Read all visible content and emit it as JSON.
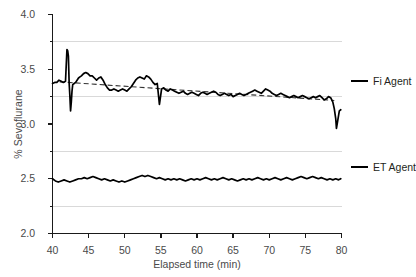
{
  "chart_data": {
    "type": "line",
    "title": "",
    "xlabel": "Elapsed time (min)",
    "ylabel": "% Sevoflurane",
    "xlim": [
      40,
      80
    ],
    "ylim": [
      2.0,
      4.0
    ],
    "xticks": [
      40,
      45,
      50,
      55,
      60,
      65,
      70,
      75,
      80
    ],
    "xtick_labels": [
      "40",
      "45",
      "50",
      "55",
      "60",
      "65",
      "70",
      "75",
      "80"
    ],
    "yticks": [
      2.0,
      2.5,
      3.0,
      3.5,
      4.0
    ],
    "ytick_labels": [
      "2.0",
      "2.5",
      "3.0",
      "3.5",
      "4.0"
    ],
    "yminorticks": [
      2.25,
      2.75,
      3.25,
      3.75
    ],
    "grid": "horizontal-minor",
    "gridlines": [
      2.25,
      2.75,
      3.25,
      3.75
    ],
    "legend_position": "right",
    "legend": [
      "Fi Agent",
      "ET Agent"
    ],
    "annotations": [
      "dashed linear trend line fitted to Fi Agent trace"
    ],
    "trendline": {
      "name": "Fi Agent trend",
      "style": "dashed",
      "x": [
        41.0,
        79.0
      ],
      "y": [
        3.385,
        3.215
      ]
    },
    "series": [
      {
        "name": "Fi Agent",
        "color": "#000000",
        "x": [
          40.0,
          40.3,
          40.6,
          40.9,
          41.2,
          41.5,
          41.8,
          42.0,
          42.1,
          42.2,
          42.3,
          42.4,
          42.5,
          42.6,
          42.7,
          42.8,
          43.0,
          43.2,
          43.4,
          43.6,
          43.8,
          44.0,
          44.3,
          44.6,
          44.9,
          45.2,
          45.5,
          45.8,
          46.1,
          46.4,
          46.7,
          47.0,
          47.3,
          47.6,
          47.9,
          48.2,
          48.5,
          48.8,
          49.1,
          49.4,
          49.7,
          50.0,
          50.3,
          50.6,
          50.9,
          51.2,
          51.5,
          51.8,
          52.1,
          52.4,
          52.7,
          53.0,
          53.3,
          53.6,
          53.9,
          54.2,
          54.5,
          54.8,
          55.1,
          55.4,
          55.7,
          56.0,
          56.3,
          56.6,
          56.9,
          57.2,
          57.5,
          57.8,
          58.1,
          58.4,
          58.7,
          59.0,
          59.3,
          59.6,
          59.9,
          60.2,
          60.5,
          60.8,
          61.1,
          61.4,
          61.7,
          62.0,
          62.3,
          62.6,
          62.9,
          63.2,
          63.5,
          63.8,
          64.1,
          64.4,
          64.7,
          65.0,
          65.3,
          65.6,
          65.9,
          66.2,
          66.5,
          66.8,
          67.1,
          67.4,
          67.7,
          68.0,
          68.3,
          68.6,
          68.9,
          69.2,
          69.5,
          69.8,
          70.1,
          70.4,
          70.7,
          71.0,
          71.3,
          71.6,
          71.9,
          72.2,
          72.5,
          72.8,
          73.1,
          73.4,
          73.7,
          74.0,
          74.3,
          74.6,
          74.9,
          75.2,
          75.5,
          75.8,
          76.1,
          76.4,
          76.7,
          77.0,
          77.3,
          77.6,
          77.9,
          78.2,
          78.5,
          78.8,
          79.0,
          79.2,
          79.3,
          79.5,
          79.7,
          79.9
        ],
        "y": [
          3.37,
          3.38,
          3.38,
          3.4,
          3.39,
          3.38,
          3.39,
          3.68,
          3.67,
          3.62,
          3.38,
          3.26,
          3.12,
          3.2,
          3.3,
          3.36,
          3.37,
          3.38,
          3.4,
          3.42,
          3.43,
          3.44,
          3.46,
          3.47,
          3.46,
          3.44,
          3.44,
          3.42,
          3.4,
          3.42,
          3.43,
          3.4,
          3.36,
          3.33,
          3.31,
          3.31,
          3.32,
          3.31,
          3.3,
          3.31,
          3.32,
          3.31,
          3.3,
          3.32,
          3.34,
          3.37,
          3.4,
          3.42,
          3.43,
          3.42,
          3.41,
          3.44,
          3.43,
          3.41,
          3.38,
          3.36,
          3.37,
          3.18,
          3.32,
          3.33,
          3.31,
          3.3,
          3.32,
          3.31,
          3.3,
          3.29,
          3.28,
          3.29,
          3.3,
          3.28,
          3.27,
          3.28,
          3.29,
          3.28,
          3.27,
          3.26,
          3.28,
          3.29,
          3.28,
          3.27,
          3.28,
          3.29,
          3.3,
          3.29,
          3.27,
          3.26,
          3.27,
          3.28,
          3.27,
          3.26,
          3.27,
          3.25,
          3.26,
          3.27,
          3.28,
          3.27,
          3.26,
          3.27,
          3.28,
          3.29,
          3.3,
          3.31,
          3.3,
          3.29,
          3.28,
          3.3,
          3.32,
          3.31,
          3.3,
          3.28,
          3.27,
          3.26,
          3.27,
          3.28,
          3.27,
          3.26,
          3.25,
          3.24,
          3.25,
          3.26,
          3.25,
          3.24,
          3.25,
          3.26,
          3.25,
          3.24,
          3.23,
          3.24,
          3.25,
          3.24,
          3.25,
          3.26,
          3.24,
          3.22,
          3.23,
          3.25,
          3.24,
          3.2,
          3.14,
          3.05,
          2.96,
          3.04,
          3.12,
          3.13
        ]
      },
      {
        "name": "ET Agent",
        "color": "#000000",
        "x": [
          40.0,
          40.4,
          40.8,
          41.2,
          41.6,
          42.0,
          42.4,
          42.8,
          43.2,
          43.6,
          44.0,
          44.4,
          44.8,
          45.2,
          45.6,
          46.0,
          46.4,
          46.8,
          47.2,
          47.6,
          48.0,
          48.4,
          48.8,
          49.2,
          49.6,
          50.0,
          50.4,
          50.8,
          51.2,
          51.6,
          52.0,
          52.4,
          52.8,
          53.2,
          53.6,
          54.0,
          54.4,
          54.8,
          55.2,
          55.6,
          56.0,
          56.4,
          56.8,
          57.2,
          57.6,
          58.0,
          58.4,
          58.8,
          59.2,
          59.6,
          60.0,
          60.4,
          60.8,
          61.2,
          61.6,
          62.0,
          62.4,
          62.8,
          63.2,
          63.6,
          64.0,
          64.4,
          64.8,
          65.2,
          65.6,
          66.0,
          66.4,
          66.8,
          67.2,
          67.6,
          68.0,
          68.4,
          68.8,
          69.2,
          69.6,
          70.0,
          70.4,
          70.8,
          71.2,
          71.6,
          72.0,
          72.4,
          72.8,
          73.2,
          73.6,
          74.0,
          74.4,
          74.8,
          75.2,
          75.6,
          76.0,
          76.4,
          76.8,
          77.2,
          77.6,
          78.0,
          78.4,
          78.8,
          79.2,
          79.6,
          79.9
        ],
        "y": [
          2.5,
          2.48,
          2.47,
          2.48,
          2.49,
          2.48,
          2.47,
          2.48,
          2.49,
          2.5,
          2.5,
          2.51,
          2.5,
          2.51,
          2.52,
          2.51,
          2.5,
          2.49,
          2.5,
          2.49,
          2.48,
          2.49,
          2.48,
          2.47,
          2.48,
          2.47,
          2.48,
          2.49,
          2.5,
          2.51,
          2.52,
          2.53,
          2.52,
          2.53,
          2.52,
          2.51,
          2.5,
          2.51,
          2.5,
          2.49,
          2.5,
          2.49,
          2.5,
          2.49,
          2.5,
          2.49,
          2.48,
          2.49,
          2.5,
          2.49,
          2.5,
          2.49,
          2.5,
          2.51,
          2.5,
          2.49,
          2.5,
          2.49,
          2.5,
          2.51,
          2.5,
          2.49,
          2.5,
          2.49,
          2.48,
          2.49,
          2.5,
          2.49,
          2.5,
          2.49,
          2.5,
          2.51,
          2.5,
          2.49,
          2.5,
          2.49,
          2.5,
          2.51,
          2.5,
          2.49,
          2.5,
          2.51,
          2.5,
          2.49,
          2.5,
          2.51,
          2.52,
          2.51,
          2.5,
          2.51,
          2.52,
          2.51,
          2.5,
          2.51,
          2.5,
          2.49,
          2.5,
          2.49,
          2.5,
          2.49,
          2.5
        ]
      }
    ]
  },
  "legend": {
    "items": [
      {
        "label": "Fi Agent"
      },
      {
        "label": "ET Agent"
      }
    ]
  },
  "axes": {
    "y_title": "% Sevoflurane",
    "x_title": "Elapsed time (min)"
  },
  "colors": {
    "trace": "#000000",
    "grid": "#d9d9d9",
    "axis": "#1a1a1a",
    "tick_text": "#4a4a4a"
  }
}
